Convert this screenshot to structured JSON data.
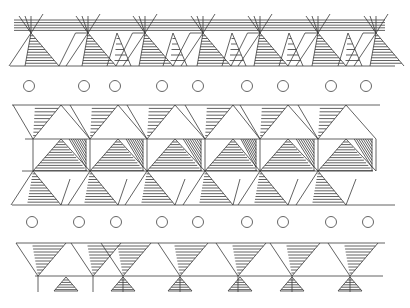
{
  "artwork": {
    "title": "Geometric triangle frieze pattern",
    "colors": {
      "background": "#ffffff",
      "line": "#3a3a3a",
      "circle": "#555555"
    },
    "circle_radius": 5.5,
    "circle_rows": [
      {
        "y": 86,
        "x": [
          29,
          84,
          115,
          162,
          198,
          247,
          283,
          331,
          366
        ]
      },
      {
        "y": 222,
        "x": [
          32,
          79,
          116,
          162,
          198,
          247,
          283,
          331,
          368
        ]
      }
    ],
    "bands": [
      {
        "name": "top-band",
        "hatch_top": 20,
        "apex_y": 33,
        "base_y": 66,
        "x_start": 10,
        "x_end": 395,
        "nodes": [
          31,
          88,
          117,
          145,
          173,
          203,
          232,
          260,
          289,
          318,
          348,
          376
        ]
      },
      {
        "name": "middle-band",
        "top_y": 105,
        "row1_y": 139,
        "row2_y": 171,
        "base_y": 205,
        "x_start": 12,
        "x_end": 395,
        "nodes": [
          33,
          90,
          118,
          147,
          175,
          205,
          232,
          260,
          289,
          318,
          348,
          376
        ]
      },
      {
        "name": "bottom-band",
        "top_y": 243,
        "line_y": 276,
        "tick_bottom": 292,
        "x_start": 16,
        "x_end": 385,
        "nodes": [
          38,
          93,
          123,
          150,
          180,
          208,
          238,
          263,
          292,
          320,
          350,
          373
        ],
        "small_triangles": [
          66,
          123,
          180,
          240,
          292,
          350
        ]
      }
    ]
  }
}
